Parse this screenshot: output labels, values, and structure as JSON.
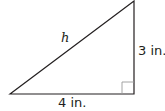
{
  "diagram": {
    "type": "right-triangle",
    "labels": {
      "hypotenuse": "h",
      "vertical_leg": "3 in.",
      "horizontal_leg": "4 in."
    },
    "right_angle_marker": true,
    "colors": {
      "stroke": "#231f20",
      "marker": "#9a9a9a",
      "background": "#ffffff"
    }
  }
}
